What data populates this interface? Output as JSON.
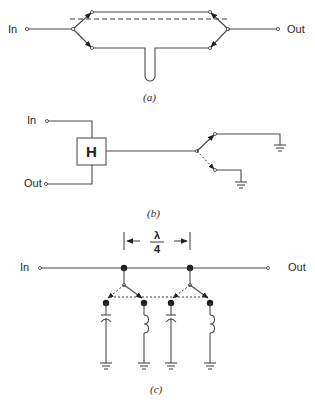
{
  "figure": {
    "a": {
      "caption": "(a)",
      "input_label": "In",
      "output_label": "Out",
      "description": "Two-path switched line with upper path and lower path containing a U-shaped stub; dashed line indicates ganged switches"
    },
    "b": {
      "caption": "(b)",
      "input_label": "In",
      "output_label": "Out",
      "hybrid_label": "H",
      "description": "Hybrid coupler feeding a switch selecting between two grounded (shorted) line lengths"
    },
    "c": {
      "caption": "(c)",
      "input_label": "In",
      "output_label": "Out",
      "spacing_label_numerator": "λ",
      "spacing_label_denominator": "4",
      "description": "Main line with two shunt switch nodes spaced λ/4, each switching between a capacitor and inductor to ground"
    }
  },
  "colors": {
    "line": "#4a4a4a",
    "node": "#1e1e1e",
    "background": "#ffffff"
  }
}
